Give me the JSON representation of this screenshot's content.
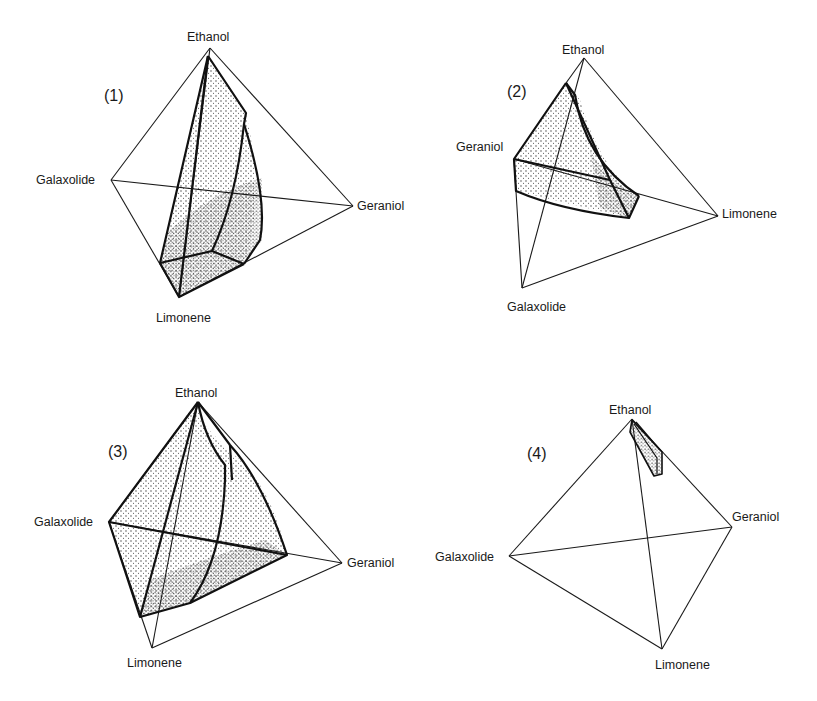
{
  "figure": {
    "panels": [
      {
        "id": "(1)",
        "labels": {
          "top": "Ethanol",
          "left": "Galaxolide",
          "right": "Geraniol",
          "bottom": "Limonene"
        }
      },
      {
        "id": "(2)",
        "labels": {
          "top": "Ethanol",
          "left": "Geraniol",
          "right": "Limonene",
          "bottom": "Galaxolide"
        }
      },
      {
        "id": "(3)",
        "labels": {
          "top": "Ethanol",
          "left": "Galaxolide",
          "right": "Geraniol",
          "bottom": "Limonene"
        }
      },
      {
        "id": "(4)",
        "labels": {
          "top": "Ethanol",
          "left": "Galaxolide",
          "right": "Geraniol",
          "bottom": "Limonene"
        }
      }
    ],
    "colors": {
      "line": "#1a1a1a",
      "stipple": "#333333",
      "background": "#ffffff"
    }
  }
}
